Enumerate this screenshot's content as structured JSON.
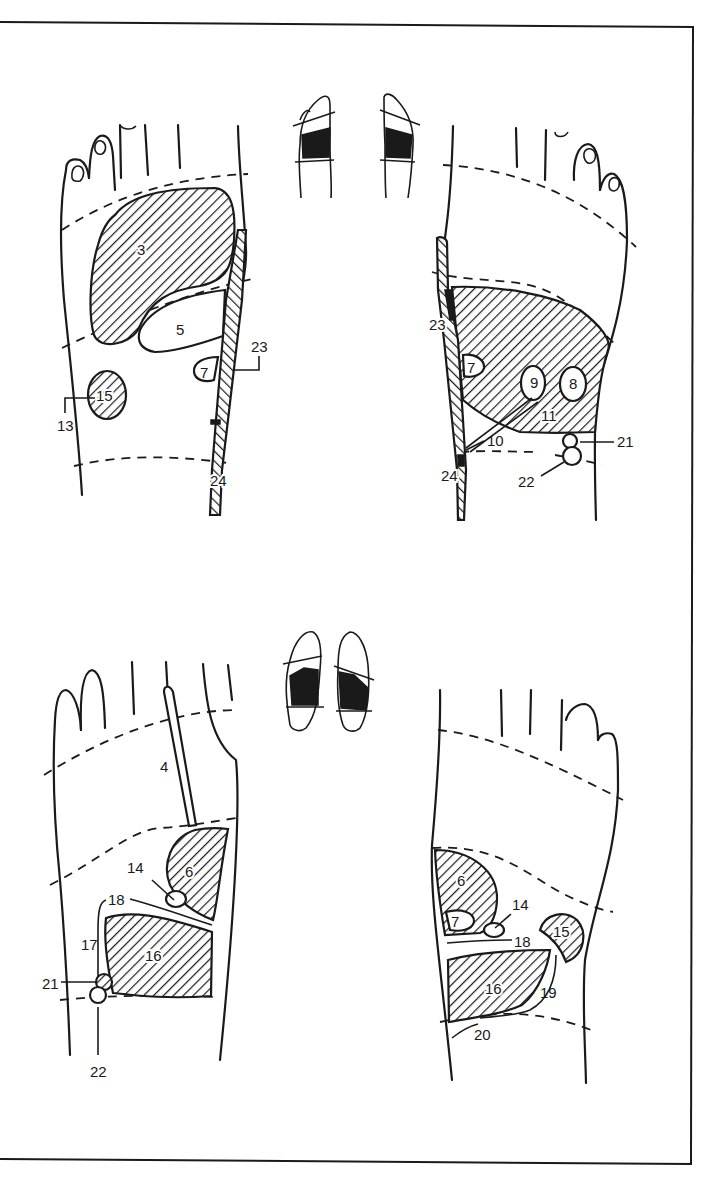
{
  "figure": {
    "frame": {
      "border_color": "#1a1a1a",
      "background": "#ffffff"
    },
    "panels": [
      {
        "id": "top-left",
        "view": "dorsal (top of foot), right foot",
        "labels": [
          {
            "num": "3",
            "x": 143,
            "y": 250
          },
          {
            "num": "5",
            "x": 181,
            "y": 331
          },
          {
            "num": "23",
            "x": 260,
            "y": 349
          },
          {
            "num": "7",
            "x": 205,
            "y": 374
          },
          {
            "num": "15",
            "x": 106,
            "y": 398
          },
          {
            "num": "13",
            "x": 66,
            "y": 431
          },
          {
            "num": "24",
            "x": 220,
            "y": 486
          }
        ]
      },
      {
        "id": "top-right",
        "view": "dorsal (top of foot), left foot",
        "labels": [
          {
            "num": "23",
            "x": 430,
            "y": 327
          },
          {
            "num": "7",
            "x": 472,
            "y": 369
          },
          {
            "num": "9",
            "x": 535,
            "y": 383
          },
          {
            "num": "8",
            "x": 575,
            "y": 383
          },
          {
            "num": "11",
            "x": 548,
            "y": 417
          },
          {
            "num": "10",
            "x": 505,
            "y": 446
          },
          {
            "num": "21",
            "x": 617,
            "y": 447
          },
          {
            "num": "24",
            "x": 443,
            "y": 478
          },
          {
            "num": "22",
            "x": 527,
            "y": 487
          }
        ]
      },
      {
        "id": "bottom-left",
        "view": "plantar (sole), right foot",
        "labels": [
          {
            "num": "4",
            "x": 166,
            "y": 772
          },
          {
            "num": "14",
            "x": 136,
            "y": 873
          },
          {
            "num": "6",
            "x": 190,
            "y": 876
          },
          {
            "num": "18",
            "x": 117,
            "y": 905
          },
          {
            "num": "17",
            "x": 89,
            "y": 950
          },
          {
            "num": "16",
            "x": 153,
            "y": 962
          },
          {
            "num": "21",
            "x": 45,
            "y": 989
          },
          {
            "num": "22",
            "x": 99,
            "y": 1076
          }
        ]
      },
      {
        "id": "bottom-right",
        "view": "plantar (sole), left foot",
        "labels": [
          {
            "num": "6",
            "x": 462,
            "y": 883
          },
          {
            "num": "14",
            "x": 522,
            "y": 910
          },
          {
            "num": "7",
            "x": 455,
            "y": 925
          },
          {
            "num": "15",
            "x": 562,
            "y": 935
          },
          {
            "num": "18",
            "x": 519,
            "y": 944
          },
          {
            "num": "16",
            "x": 493,
            "y": 993
          },
          {
            "num": "19",
            "x": 547,
            "y": 998
          },
          {
            "num": "20",
            "x": 481,
            "y": 1038
          }
        ]
      }
    ],
    "thumbnails": [
      {
        "id": "top-thumbs",
        "view": "dorsal pair, shaded middle band"
      },
      {
        "id": "bottom-thumbs",
        "view": "plantar pair, shaded midfoot band"
      }
    ]
  }
}
